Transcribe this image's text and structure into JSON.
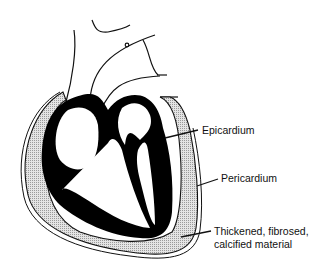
{
  "figure": {
    "labels": {
      "epicardium": "Epicardium",
      "pericardium": "Pericardium",
      "thickened_line1": "Thickened, fibrosed,",
      "thickened_line2": "calcified material"
    },
    "colors": {
      "background": "#ffffff",
      "myocardium": "#000000",
      "outline": "#111111",
      "stipple": "#bdbdbd"
    }
  }
}
